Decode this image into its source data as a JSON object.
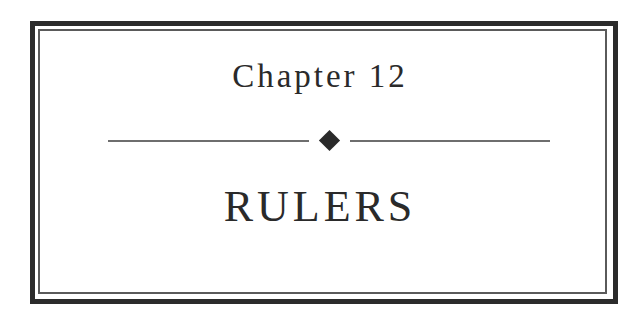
{
  "page": {
    "chapter_label": "Chapter 12",
    "title": "RULERS",
    "ornament": "diamond-icon",
    "colors": {
      "border": "#2b2b2b",
      "inner_border": "#5a5a5a",
      "text": "#2a2a2a",
      "rule": "#6e6e6e",
      "background": "#ffffff"
    }
  }
}
